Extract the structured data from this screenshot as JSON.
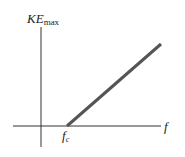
{
  "diagram": {
    "y_axis_label": "KE",
    "y_axis_label_sub": "max",
    "x_axis_label": "f",
    "threshold_label": "f",
    "threshold_label_sub": "c",
    "line_color": "#555555",
    "axis_color": "#333333"
  }
}
